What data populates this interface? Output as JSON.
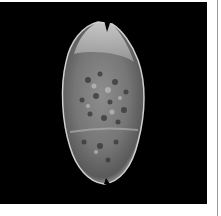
{
  "image": {
    "subject": "Cowrie shell (dorsal view) on black background",
    "alt": "Grayscale photo of a spotted cowrie shell",
    "colors": {
      "background": "#000000",
      "page": "#ffffff",
      "divider": "#9a9a9a"
    }
  }
}
